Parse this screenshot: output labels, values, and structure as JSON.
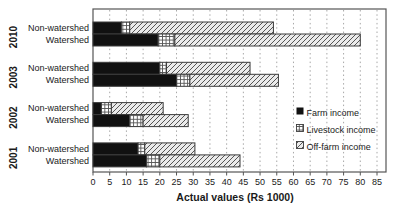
{
  "chart_data": {
    "type": "bar",
    "orientation": "horizontal",
    "stacked": true,
    "title": "",
    "xlabel": "Actual values (Rs 1000)",
    "ylabel": "",
    "xlim": [
      0,
      85
    ],
    "xticks": [
      0,
      5,
      10,
      15,
      20,
      25,
      30,
      35,
      40,
      45,
      50,
      55,
      60,
      65,
      70,
      75,
      80,
      85
    ],
    "grid": "vertical-dotted",
    "legend_position": "middle-right",
    "group_labels": [
      "2010",
      "2003",
      "2002",
      "2001"
    ],
    "categories": [
      "Non-watershed",
      "Watershed",
      "Non-watershed",
      "Watershed",
      "Non-watershed",
      "Watershed",
      "Non-watershed",
      "Watershed"
    ],
    "series": [
      {
        "name": "Farm income",
        "style": "solid-black",
        "values": [
          8.5,
          19.5,
          20,
          25,
          2.5,
          11,
          13.5,
          16
        ]
      },
      {
        "name": "Livestock income",
        "style": "crosshatch",
        "values": [
          2.5,
          5,
          2,
          4,
          3,
          4,
          2,
          4
        ]
      },
      {
        "name": "Off-farm income",
        "style": "diagonal-hatch",
        "values": [
          43,
          55.5,
          25,
          26.5,
          15.5,
          13.5,
          15,
          24
        ]
      }
    ],
    "totals": [
      54,
      80,
      47,
      55.5,
      21,
      28.5,
      30.5,
      44
    ]
  },
  "colors": {
    "farm_fill": "#111111",
    "offfarm_fill": "#ebebeb",
    "crosshatch_bg": "#ffffff",
    "hatch_line": "#555555",
    "bar_border": "#3c3c3c",
    "gridline": "#a8a8a8",
    "frame": "#555555",
    "text": "#1a1a1a",
    "background": "#ffffff"
  }
}
